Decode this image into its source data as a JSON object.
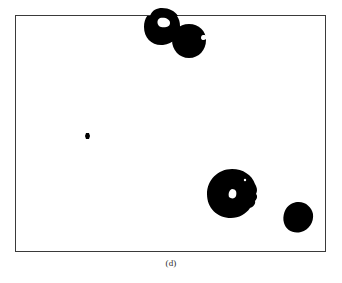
{
  "figure": {
    "caption": "(d)",
    "panel_label": "(d)",
    "background_color": "#ffffff",
    "foreground_color": "#000000",
    "frame_color": "#3a3a3a",
    "frame": {
      "x": 15,
      "y": 15,
      "width": 311,
      "height": 237
    },
    "objects": [
      {
        "name": "blob-top-left",
        "label": "large ring blob with interior hole, clipped by top frame edge",
        "center": [
          162,
          27
        ],
        "radius": 18,
        "fill": "#000000",
        "hole": {
          "center": [
            164,
            22
          ],
          "rx": 5,
          "ry": 4,
          "fill": "#ffffff"
        }
      },
      {
        "name": "blob-top-right",
        "label": "round blob with right-side notch, overlapping top-left blob",
        "center": [
          189,
          41
        ],
        "radius": 17,
        "fill": "#000000",
        "notch": {
          "center": [
            205,
            39
          ],
          "rx": 4,
          "ry": 3,
          "fill": "#ffffff"
        }
      },
      {
        "name": "blob-small-dot",
        "label": "small isolated dot",
        "center": [
          87,
          136
        ],
        "radius": 2.3,
        "fill": "#000000"
      },
      {
        "name": "blob-bottom-center",
        "label": "largest blob with white interior hole and ragged right edge",
        "center": [
          232,
          194
        ],
        "radius": 25,
        "fill": "#000000",
        "hole": {
          "center": [
            233,
            194
          ],
          "rx": 3.6,
          "ry": 4.2,
          "fill": "#ffffff"
        },
        "speck": {
          "center": [
            245,
            180
          ],
          "radius": 1.1,
          "fill": "#ffffff"
        }
      },
      {
        "name": "blob-bottom-right",
        "label": "medium rounded polygonal blob",
        "center": [
          298,
          217
        ],
        "radius": 16,
        "fill": "#000000"
      }
    ]
  }
}
